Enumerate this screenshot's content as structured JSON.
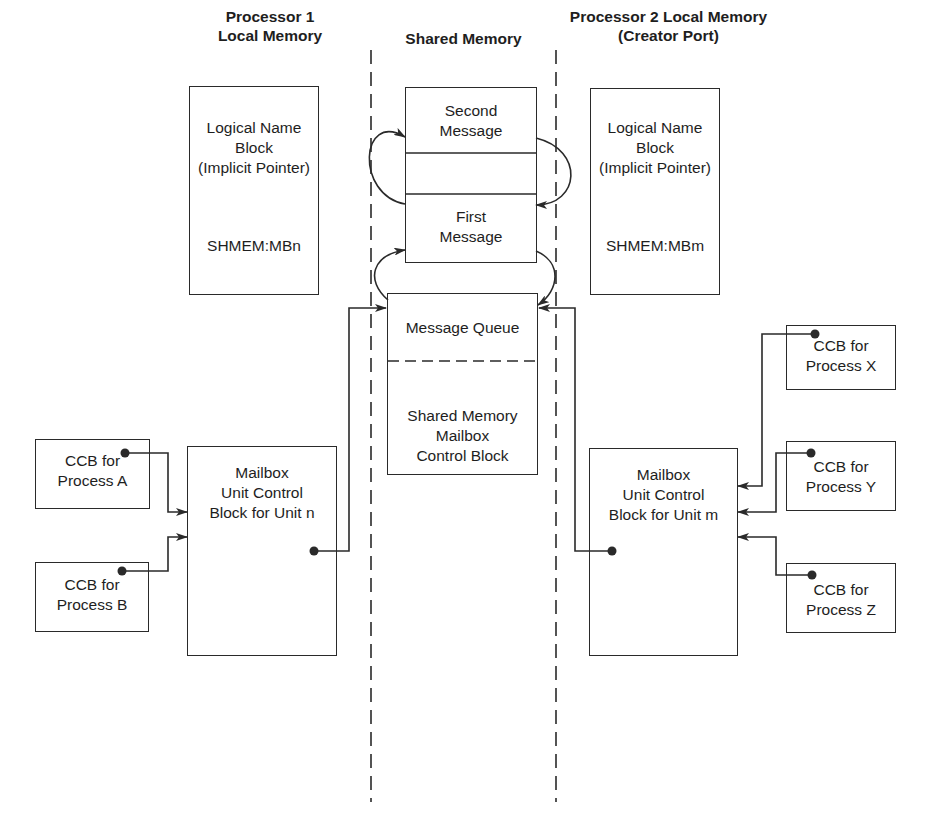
{
  "headers": {
    "p1": "Processor 1\nLocal Memory",
    "shared": "Shared Memory",
    "p2": "Processor 2 Local Memory\n(Creator Port)"
  },
  "p1_logical_block": {
    "title": "Logical Name\nBlock\n(Implicit Pointer)",
    "name": "SHMEM:MBn"
  },
  "p2_logical_block": {
    "title": "Logical Name\nBlock\n(Implicit Pointer)",
    "name": "SHMEM:MBm"
  },
  "shared_memory": {
    "second_message": "Second\nMessage",
    "first_message": "First\nMessage",
    "message_queue": "Message Queue",
    "control_block": "Shared Memory\nMailbox\nControl Block"
  },
  "p1_ucb": "Mailbox\nUnit Control\nBlock for Unit n",
  "p2_ucb": "Mailbox\nUnit Control\nBlock for Unit m",
  "ccbs": {
    "a": "CCB for\nProcess A",
    "b": "CCB for\nProcess B",
    "x": "CCB for\nProcess X",
    "y": "CCB for\nProcess Y",
    "z": "CCB for\nProcess Z"
  },
  "colors": {
    "ink": "#2a2a2a",
    "background": "#ffffff"
  }
}
